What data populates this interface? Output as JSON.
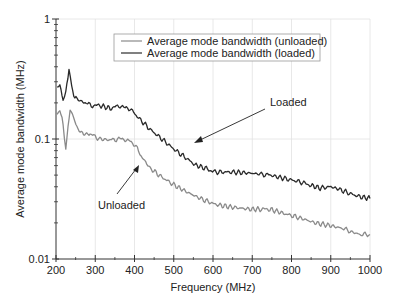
{
  "chart_data": {
    "type": "line",
    "title": "",
    "xlabel": "Frequency (MHz)",
    "ylabel": "Average mode bandwidth (MHz)",
    "xlim": [
      200,
      1000
    ],
    "ylim": [
      0.01,
      1
    ],
    "yscale": "log",
    "xticks": [
      200,
      300,
      400,
      500,
      600,
      700,
      800,
      900,
      1000
    ],
    "yticks": [
      0.01,
      0.1,
      1
    ],
    "ytick_labels": [
      "0.01",
      "0.1",
      "1"
    ],
    "grid": true,
    "legend_position": "upper center",
    "series": [
      {
        "name": "Average mode bandwidth (unloaded)",
        "color": "#8a8a8a",
        "x": [
          203,
          210,
          218,
          225,
          236,
          248,
          256,
          270,
          287,
          312,
          338,
          363,
          376,
          389,
          401,
          420,
          440,
          470,
          503,
          535,
          567,
          600,
          618,
          650,
          694,
          720,
          745,
          780,
          822,
          860,
          898,
          930,
          949,
          975,
          1000
        ],
        "values": [
          0.16,
          0.18,
          0.13,
          0.084,
          0.18,
          0.14,
          0.12,
          0.11,
          0.11,
          0.1,
          0.098,
          0.1,
          0.1,
          0.095,
          0.089,
          0.07,
          0.057,
          0.048,
          0.041,
          0.036,
          0.032,
          0.029,
          0.028,
          0.027,
          0.026,
          0.026,
          0.026,
          0.024,
          0.022,
          0.02,
          0.019,
          0.018,
          0.017,
          0.016,
          0.016
        ]
      },
      {
        "name": "Average mode bandwidth (loaded)",
        "color": "#2a2a2a",
        "x": [
          203,
          210,
          218,
          225,
          233,
          240,
          248,
          260,
          274,
          290,
          312,
          338,
          363,
          376,
          389,
          410,
          440,
          470,
          503,
          530,
          554,
          580,
          605,
          650,
          694,
          720,
          745,
          780,
          822,
          850,
          873,
          900,
          923,
          950,
          974,
          1000
        ],
        "values": [
          0.26,
          0.28,
          0.21,
          0.24,
          0.39,
          0.27,
          0.22,
          0.21,
          0.2,
          0.19,
          0.19,
          0.18,
          0.19,
          0.18,
          0.18,
          0.15,
          0.12,
          0.1,
          0.081,
          0.07,
          0.061,
          0.057,
          0.053,
          0.053,
          0.052,
          0.051,
          0.05,
          0.047,
          0.044,
          0.041,
          0.039,
          0.04,
          0.038,
          0.035,
          0.033,
          0.032
        ]
      }
    ],
    "annotations": [
      {
        "text": "Loaded",
        "arrow_to": {
          "x": 550,
          "y": 0.075
        }
      },
      {
        "text": "Unloaded",
        "arrow_to": {
          "x": 410,
          "y": 0.09
        }
      }
    ]
  },
  "labels": {
    "xlabel": "Frequency (MHz)",
    "ylabel": "Average mode bandwidth (MHz)",
    "legend": [
      "Average mode bandwidth (unloaded)",
      "Average mode bandwidth (loaded)"
    ],
    "annot_loaded": "Loaded",
    "annot_unloaded": "Unloaded"
  }
}
